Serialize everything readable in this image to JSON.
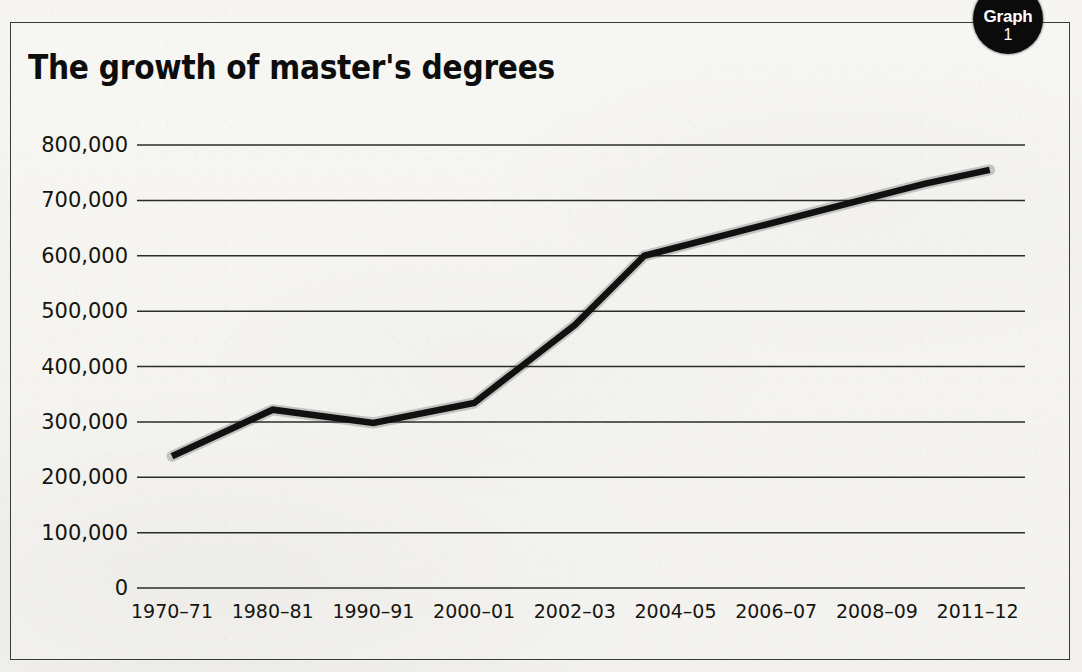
{
  "badge": {
    "label": "Graph",
    "number": "1"
  },
  "bleed_through_text": "                                               ",
  "chart_data": {
    "type": "line",
    "title": "The growth of master's degrees",
    "xlabel": "",
    "ylabel": "",
    "grid": true,
    "legend": null,
    "ylim": [
      0,
      800000
    ],
    "ytick_values": [
      0,
      100000,
      200000,
      300000,
      400000,
      500000,
      600000,
      700000,
      800000
    ],
    "ytick_labels": [
      "0",
      "100,000",
      "200,000",
      "300,000",
      "400,000",
      "500,000",
      "600,000",
      "700,000",
      "800,000"
    ],
    "categories": [
      "1970–71",
      "1980–81",
      "1990–91",
      "2000–01",
      "2002–03",
      "2004–05",
      "2006–07",
      "2008–09",
      "2011–12"
    ],
    "series": [
      {
        "name": "Master's degrees conferred",
        "color": "#111111",
        "values": [
          238000,
          322000,
          298000,
          334000,
          475000,
          625000,
          675000,
          730000,
          755000
        ],
        "vertices": [
          {
            "x_frac": 0.0,
            "value": 238000
          },
          {
            "x_frac": 1.0,
            "value": 322000
          },
          {
            "x_frac": 2.0,
            "value": 298000
          },
          {
            "x_frac": 3.0,
            "value": 334000
          },
          {
            "x_frac": 4.0,
            "value": 475000
          },
          {
            "x_frac": 4.69,
            "value": 600000
          },
          {
            "x_frac": 7.47,
            "value": 730000
          },
          {
            "x_frac": 8.12,
            "value": 755000
          }
        ]
      }
    ]
  }
}
